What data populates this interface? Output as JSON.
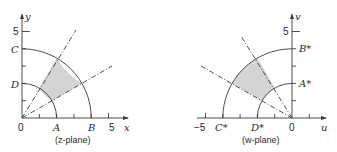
{
  "colors": {
    "ink": "#3a3a3a",
    "shade": "#d4d4d4",
    "background": "#ffffff"
  },
  "z_plane": {
    "caption": "(z-plane)",
    "x_axis_label": "x",
    "y_axis_label": "y",
    "origin_label": "0",
    "x_tick_label": "5",
    "y_tick_label": "5",
    "points": {
      "A": "A",
      "B": "B",
      "C": "C",
      "D": "D"
    },
    "radii": [
      2,
      4
    ],
    "ray_angles_deg": [
      30,
      60
    ]
  },
  "w_plane": {
    "caption": "(w-plane)",
    "x_axis_label": "u",
    "y_axis_label": "v",
    "origin_label": "0",
    "x_tick_label": "−5",
    "y_tick_label": "5",
    "points": {
      "A": "A*",
      "B": "B*",
      "C": "C*",
      "D": "D*"
    },
    "radii": [
      2,
      4
    ],
    "ray_angles_deg": [
      120,
      150
    ]
  }
}
